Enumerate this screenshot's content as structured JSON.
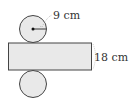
{
  "diagram": {
    "radius_label": "9 cm",
    "height_label": "18 cm",
    "colors": {
      "fill": "#e9e9e9",
      "stroke": "#444444",
      "dashed": "#aaaaaa"
    }
  }
}
